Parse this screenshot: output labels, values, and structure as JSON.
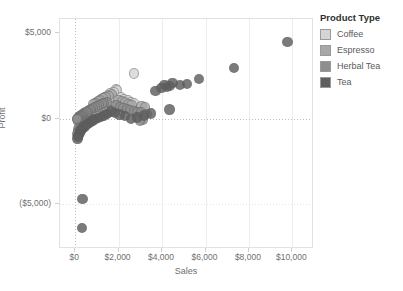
{
  "chart_data": {
    "type": "scatter",
    "title": "",
    "xlabel": "Sales",
    "ylabel": "Profit",
    "xlim": [
      -700,
      11000
    ],
    "ylim": [
      -7600,
      5800
    ],
    "grid": true,
    "legend_position": "right",
    "x_ticks": [
      "$0",
      "$2,000",
      "$4,000",
      "$6,000",
      "$8,000",
      "$10,000"
    ],
    "x_tick_values": [
      0,
      2000,
      4000,
      6000,
      8000,
      10000
    ],
    "y_ticks": [
      "$5,000",
      "$0",
      "($5,000)"
    ],
    "y_tick_values": [
      5000,
      0,
      -5000
    ],
    "legend_title": "Product Type",
    "series": [
      {
        "name": "Coffee",
        "color": "#d5d5d5",
        "points": [
          [
            2700,
            2620
          ],
          [
            1870,
            1700
          ],
          [
            1930,
            1660
          ],
          [
            1760,
            1560
          ],
          [
            1600,
            1480
          ],
          [
            1500,
            1340
          ],
          [
            1380,
            1250
          ],
          [
            1290,
            1180
          ],
          [
            1200,
            1120
          ],
          [
            1100,
            1010
          ],
          [
            1010,
            930
          ],
          [
            2100,
            1230
          ],
          [
            2260,
            1150
          ],
          [
            2420,
            1060
          ],
          [
            2560,
            980
          ],
          [
            2700,
            900
          ],
          [
            1950,
            870
          ],
          [
            1780,
            800
          ],
          [
            1620,
            740
          ],
          [
            1460,
            690
          ],
          [
            1320,
            640
          ],
          [
            1180,
            590
          ],
          [
            1040,
            540
          ],
          [
            900,
            480
          ],
          [
            800,
            430
          ],
          [
            700,
            380
          ],
          [
            620,
            330
          ],
          [
            540,
            280
          ],
          [
            470,
            230
          ],
          [
            410,
            180
          ],
          [
            350,
            130
          ],
          [
            300,
            90
          ],
          [
            255,
            55
          ],
          [
            215,
            25
          ],
          [
            180,
            5
          ],
          [
            2180,
            700
          ],
          [
            2340,
            620
          ],
          [
            2500,
            545
          ],
          [
            2660,
            470
          ],
          [
            2820,
            400
          ],
          [
            2980,
            330
          ],
          [
            1460,
            300
          ],
          [
            1300,
            255
          ],
          [
            1150,
            210
          ],
          [
            1000,
            170
          ],
          [
            870,
            130
          ],
          [
            750,
            95
          ],
          [
            640,
            60
          ],
          [
            545,
            30
          ],
          [
            460,
            5
          ],
          [
            390,
            -20
          ],
          [
            330,
            -45
          ],
          [
            280,
            -70
          ],
          [
            240,
            -95
          ],
          [
            205,
            -120
          ],
          [
            175,
            -145
          ],
          [
            150,
            -170
          ]
        ]
      },
      {
        "name": "Espresso",
        "color": "#a8a8a8",
        "points": [
          [
            1680,
            1420
          ],
          [
            1540,
            1330
          ],
          [
            1400,
            1240
          ],
          [
            1270,
            1160
          ],
          [
            1150,
            1080
          ],
          [
            1040,
            1000
          ],
          [
            940,
            920
          ],
          [
            850,
            840
          ],
          [
            2000,
            1100
          ],
          [
            2150,
            1020
          ],
          [
            2300,
            940
          ],
          [
            2450,
            860
          ],
          [
            2600,
            790
          ],
          [
            1120,
            700
          ],
          [
            1010,
            640
          ],
          [
            910,
            580
          ],
          [
            820,
            520
          ],
          [
            740,
            470
          ],
          [
            665,
            420
          ],
          [
            595,
            370
          ],
          [
            530,
            320
          ],
          [
            470,
            275
          ],
          [
            415,
            230
          ],
          [
            365,
            190
          ],
          [
            320,
            150
          ],
          [
            280,
            115
          ],
          [
            245,
            80
          ],
          [
            215,
            50
          ],
          [
            190,
            25
          ],
          [
            168,
            0
          ],
          [
            148,
            -25
          ],
          [
            130,
            -50
          ],
          [
            290,
            -330
          ],
          [
            250,
            -390
          ],
          [
            215,
            -450
          ],
          [
            185,
            -510
          ],
          [
            160,
            -570
          ],
          [
            140,
            -630
          ],
          [
            400,
            -300
          ],
          [
            350,
            -360
          ],
          [
            1720,
            480
          ],
          [
            1560,
            420
          ],
          [
            1410,
            365
          ],
          [
            1270,
            310
          ],
          [
            1140,
            260
          ],
          [
            1020,
            210
          ],
          [
            3050,
            720
          ],
          [
            3200,
            640
          ]
        ]
      },
      {
        "name": "Herbal Tea",
        "color": "#8e8e8e",
        "points": [
          [
            1460,
            960
          ],
          [
            1330,
            890
          ],
          [
            1210,
            830
          ],
          [
            1100,
            770
          ],
          [
            1000,
            710
          ],
          [
            905,
            650
          ],
          [
            820,
            595
          ],
          [
            740,
            540
          ],
          [
            665,
            490
          ],
          [
            595,
            440
          ],
          [
            530,
            395
          ],
          [
            470,
            350
          ],
          [
            415,
            305
          ],
          [
            365,
            265
          ],
          [
            320,
            225
          ],
          [
            280,
            190
          ],
          [
            245,
            155
          ],
          [
            215,
            120
          ],
          [
            188,
            90
          ],
          [
            165,
            60
          ],
          [
            145,
            30
          ],
          [
            127,
            5
          ],
          [
            112,
            -20
          ],
          [
            99,
            -45
          ],
          [
            1900,
            760
          ],
          [
            2060,
            690
          ],
          [
            2220,
            620
          ],
          [
            2380,
            560
          ],
          [
            2540,
            500
          ],
          [
            2700,
            445
          ],
          [
            2870,
            395
          ],
          [
            3040,
            345
          ],
          [
            520,
            -250
          ],
          [
            455,
            -310
          ],
          [
            395,
            -370
          ],
          [
            340,
            -430
          ],
          [
            295,
            -490
          ],
          [
            255,
            -550
          ],
          [
            220,
            -610
          ],
          [
            190,
            -670
          ],
          [
            165,
            -730
          ],
          [
            143,
            -790
          ],
          [
            124,
            -850
          ],
          [
            108,
            -910
          ],
          [
            3300,
            260
          ],
          [
            3120,
            -90
          ],
          [
            2980,
            -140
          ]
        ]
      },
      {
        "name": "Tea",
        "color": "#5f5f5f",
        "points": [
          [
            9780,
            4480
          ],
          [
            7320,
            2960
          ],
          [
            5690,
            2300
          ],
          [
            5160,
            2000
          ],
          [
            4820,
            1960
          ],
          [
            4480,
            2060
          ],
          [
            4380,
            1900
          ],
          [
            4240,
            1820
          ],
          [
            4120,
            1960
          ],
          [
            3980,
            1780
          ],
          [
            3700,
            1620
          ],
          [
            4340,
            520
          ],
          [
            3480,
            300
          ],
          [
            3160,
            180
          ],
          [
            2860,
            60
          ],
          [
            2560,
            -30
          ],
          [
            2280,
            140
          ],
          [
            2040,
            230
          ],
          [
            1820,
            320
          ],
          [
            1640,
            410
          ],
          [
            1480,
            260
          ],
          [
            1330,
            180
          ],
          [
            1190,
            100
          ],
          [
            1060,
            30
          ],
          [
            940,
            -40
          ],
          [
            830,
            -110
          ],
          [
            730,
            -180
          ],
          [
            640,
            -250
          ],
          [
            560,
            -320
          ],
          [
            490,
            -390
          ],
          [
            430,
            -460
          ],
          [
            375,
            -530
          ],
          [
            325,
            -600
          ],
          [
            283,
            -670
          ],
          [
            246,
            -740
          ],
          [
            214,
            -810
          ],
          [
            186,
            -880
          ],
          [
            162,
            -950
          ],
          [
            142,
            -1020
          ],
          [
            125,
            -1090
          ],
          [
            110,
            -1160
          ],
          [
            330,
            -4700
          ],
          [
            300,
            -6380
          ]
        ]
      }
    ]
  }
}
